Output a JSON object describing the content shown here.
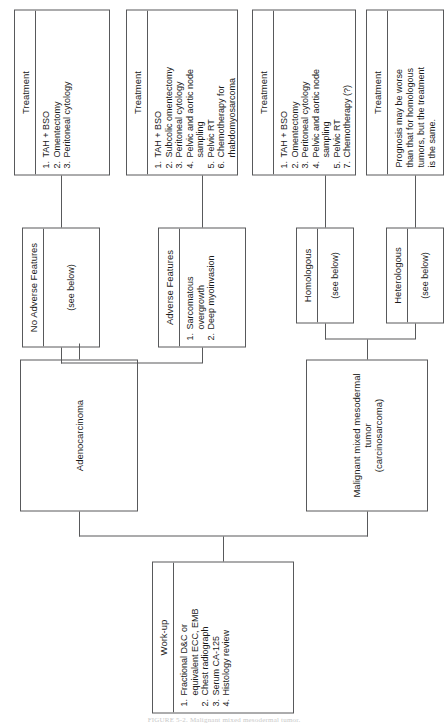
{
  "figure": {
    "caption": "FIGURE 5-2. Malignant mixed mesodermal tumor."
  },
  "nodes": {
    "workup": {
      "title": "Work-up",
      "items": [
        {
          "num": "1.",
          "text": "Fractional D&C or\n    equivalent ECC, EMB"
        },
        {
          "num": "2.",
          "text": "Chest radiograph"
        },
        {
          "num": "3.",
          "text": "Serum CA-125"
        },
        {
          "num": "4.",
          "text": "Histology review"
        }
      ]
    },
    "mmmt": {
      "title": "Malignant mixed mesodermal tumor\n(carcinosarcoma)"
    },
    "adenocarcinoma": {
      "title": "Adenocarcinoma"
    },
    "heterologous": {
      "title": "Heterologous",
      "body": "(see below)"
    },
    "homologous": {
      "title": "Homologous",
      "body": "(see below)"
    },
    "adverse_features": {
      "title": "Adverse Features",
      "items": [
        {
          "num": "1.",
          "text": "Sarcomatous overgrowth"
        },
        {
          "num": "2.",
          "text": "Deep myoinvasion"
        }
      ]
    },
    "no_adverse_features": {
      "title": "No Adverse Features",
      "body": "(see below)"
    },
    "treatment_heterologous": {
      "title": "Treatment",
      "body": "Prognosis may be worse\nthan that for homologous\ntumors, but the treatment\nis the same."
    },
    "treatment_homologous": {
      "title": "Treatment",
      "items": [
        {
          "num": "1.",
          "text": "TAH + BSO"
        },
        {
          "num": "2.",
          "text": "Omentectomy"
        },
        {
          "num": "3.",
          "text": "Peritoneal cytology"
        },
        {
          "num": "4.",
          "text": "Pelvic and aortic node\n    sampling"
        },
        {
          "num": "5.",
          "text": "Pelvic RT"
        },
        {
          "num": "7.",
          "text": "Chemotherapy (?)"
        }
      ]
    },
    "treatment_adverse": {
      "title": "Treatment",
      "items": [
        {
          "num": "1.",
          "text": "TAH + BSO"
        },
        {
          "num": "2.",
          "text": "Subcolic omentectomy"
        },
        {
          "num": "3.",
          "text": "Peritoneal cytology"
        },
        {
          "num": "4.",
          "text": "Pelvic and aortic node\n    sampling"
        },
        {
          "num": "5.",
          "text": "Pelvic RT"
        },
        {
          "num": "6.",
          "text": "Chemotherapy for\n    rhabdomyosarcoma"
        }
      ]
    },
    "treatment_no_adverse": {
      "title": "Treatment",
      "items": [
        {
          "num": "1.",
          "text": "TAH + BSO"
        },
        {
          "num": "2.",
          "text": "Omentectomy"
        },
        {
          "num": "3.",
          "text": "Peritoneal cytology"
        }
      ]
    }
  },
  "colors": {
    "line": "#58595b",
    "text": "#1a1a1a",
    "background": "#ffffff",
    "caption": "#c9c9c9"
  }
}
